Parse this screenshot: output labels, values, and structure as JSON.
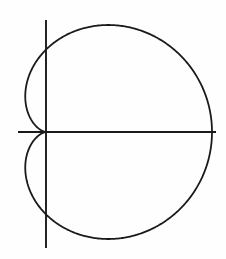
{
  "figure": {
    "title": "",
    "background_color": "#fefefe",
    "width": 226,
    "height": 259
  },
  "chart_data": {
    "type": "line",
    "plot_kind": "polar-curve-cartesian-render",
    "title": "",
    "subtitle": "",
    "xlabel": "",
    "ylabel": "",
    "curve_name": "cardioid",
    "polar_equation": "r = a(1 + cos(theta))",
    "parametric": {
      "x": "a(1 + cos(t)) * cos(t)",
      "y": "a(1 + cos(t)) * sin(t)",
      "t_range": [
        0,
        6.283185307179586
      ]
    },
    "parameter_a": 1.0,
    "cusp_point": [
      0,
      0
    ],
    "max_x_point": [
      2.0,
      0
    ],
    "max_y_point": [
      0.75,
      1.299
    ],
    "min_y_point": [
      0.75,
      -1.299
    ],
    "min_x_point": [
      -0.25,
      0.433
    ],
    "xlim": [
      -0.3,
      2.05
    ],
    "ylim": [
      -1.35,
      1.35
    ],
    "grid": false,
    "legend": null,
    "axes_shown": [
      "x-axis",
      "y-axis"
    ],
    "series": [
      {
        "name": "cardioid",
        "theta_deg": [
          0,
          15,
          30,
          45,
          60,
          75,
          90,
          105,
          120,
          135,
          150,
          165,
          180,
          195,
          210,
          225,
          240,
          255,
          270,
          285,
          300,
          315,
          330,
          345,
          360
        ],
        "r": [
          2.0,
          1.966,
          1.866,
          1.707,
          1.5,
          1.259,
          1.0,
          0.741,
          0.5,
          0.293,
          0.134,
          0.034,
          0.0,
          0.034,
          0.134,
          0.293,
          0.5,
          0.741,
          1.0,
          1.259,
          1.5,
          1.707,
          1.866,
          1.966,
          2.0
        ],
        "x": [
          2.0,
          1.899,
          1.616,
          1.207,
          0.75,
          0.326,
          0.0,
          -0.192,
          -0.25,
          -0.207,
          -0.116,
          -0.033,
          0.0,
          -0.033,
          -0.116,
          -0.207,
          -0.25,
          -0.192,
          0.0,
          0.326,
          0.75,
          1.207,
          1.616,
          1.899,
          2.0
        ],
        "y": [
          0.0,
          0.509,
          0.933,
          1.207,
          1.299,
          1.216,
          1.0,
          0.716,
          0.433,
          0.207,
          0.067,
          0.009,
          0.0,
          -0.009,
          -0.067,
          -0.207,
          -0.433,
          -0.716,
          -1.0,
          -1.216,
          -1.299,
          -1.207,
          -0.933,
          -0.509,
          0.0
        ],
        "color": "#1a1a1a",
        "linewidth": 1.8
      }
    ],
    "axis_style": {
      "color": "#1a1a1a",
      "linewidth": 1.8,
      "x_axis_pixel_span": [
        18,
        216
      ],
      "y_axis_pixel_span": [
        20,
        248
      ],
      "origin_pixel": [
        46,
        132
      ]
    }
  }
}
